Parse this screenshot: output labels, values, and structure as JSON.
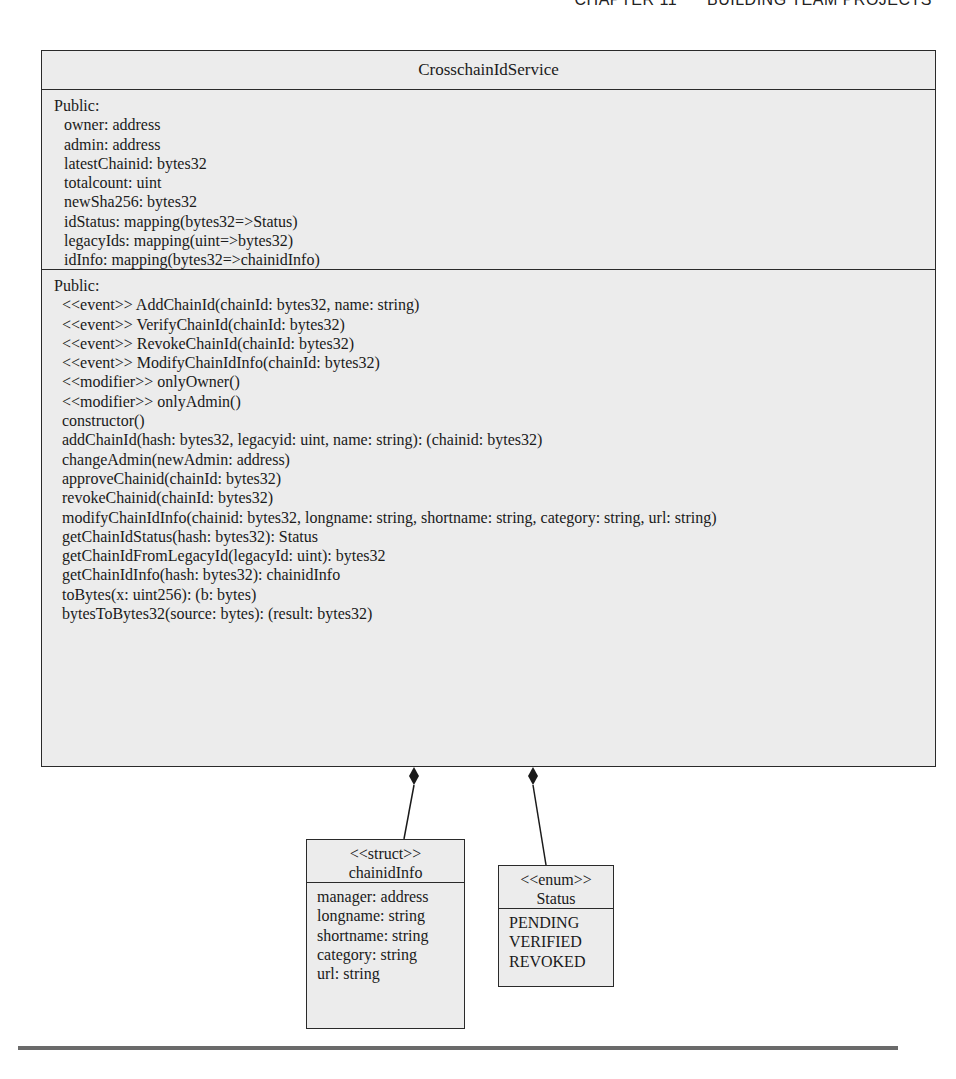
{
  "page_header": {
    "chapter": "CHAPTER 11",
    "title": "BUILDING TEAM PROJECTS"
  },
  "main_class": {
    "name": "CrosschainIdService",
    "attributes": {
      "visibility": "Public:",
      "items": [
        "owner: address",
        "admin: address",
        "latestChainid: bytes32",
        "totalcount: uint",
        "newSha256: bytes32",
        "idStatus: mapping(bytes32=>Status)",
        "legacyIds: mapping(uint=>bytes32)",
        "idInfo: mapping(bytes32=>chainidInfo)"
      ]
    },
    "operations": {
      "visibility": "Public:",
      "items": [
        "<<event>> AddChainId(chainId: bytes32, name: string)",
        "<<event>> VerifyChainId(chainId: bytes32)",
        "<<event>> RevokeChainId(chainId: bytes32)",
        "<<event>> ModifyChainIdInfo(chainId: bytes32)",
        "<<modifier>> onlyOwner()",
        "<<modifier>> onlyAdmin()",
        "constructor()",
        "addChainId(hash: bytes32, legacyid: uint, name: string): (chainid: bytes32)",
        "changeAdmin(newAdmin: address)",
        "approveChainid(chainId: bytes32)",
        "revokeChainid(chainId: bytes32)",
        "modifyChainIdInfo(chainid: bytes32, longname: string, shortname: string, category: string, url: string)",
        "getChainIdStatus(hash: bytes32): Status",
        "getChainIdFromLegacyId(legacyId: uint): bytes32",
        "getChainIdInfo(hash: bytes32): chainidInfo",
        "toBytes(x: uint256): (b: bytes)",
        "bytesToBytes32(source: bytes): (result: bytes32)"
      ]
    }
  },
  "struct_box": {
    "stereotype": "<<struct>>",
    "name": "chainidInfo",
    "fields": [
      "manager: address",
      "longname: string",
      "shortname: string",
      "category: string",
      "url: string"
    ]
  },
  "enum_box": {
    "stereotype": "<<enum>>",
    "name": "Status",
    "values": [
      "PENDING",
      "VERIFIED",
      "REVOKED"
    ]
  },
  "relationships": [
    {
      "type": "composition",
      "from": "CrosschainIdService",
      "to": "chainidInfo"
    },
    {
      "type": "composition",
      "from": "CrosschainIdService",
      "to": "Status"
    }
  ],
  "colors": {
    "box_fill": "#ececec",
    "box_border": "#2a2a2a",
    "text": "#1a1a1a",
    "rule": "#6a6a6a"
  }
}
